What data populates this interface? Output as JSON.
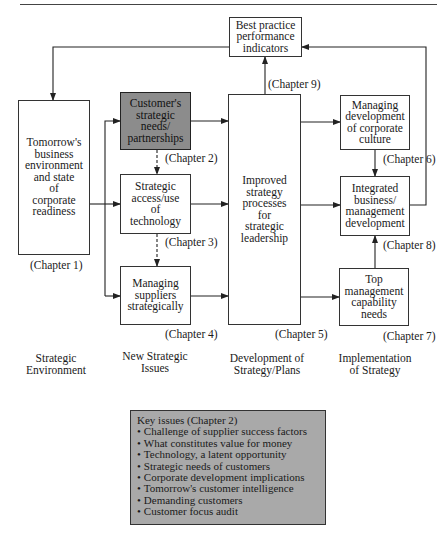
{
  "diagram": {
    "boxes": {
      "best_practice": {
        "label": "Best practice\nperformance\nindicators",
        "chapter": "(Chapter 9)"
      },
      "tomorrows_environment": {
        "label": "Tomorrow's\nbusiness\nenvironment\nand state\nof\ncorporate\nreadiness",
        "chapter": "(Chapter 1)"
      },
      "customer_needs": {
        "label": "Customer's\nstrategic\nneeds/\npartnerships",
        "chapter": "(Chapter 2)",
        "highlighted": true
      },
      "strategic_access": {
        "label": "Strategic\naccess/use\nof\ntechnology",
        "chapter": "(Chapter 3)"
      },
      "managing_suppliers": {
        "label": "Managing\nsuppliers\nstrategically",
        "chapter": "(Chapter 4)"
      },
      "improved_strategy": {
        "label": "Improved\nstrategy\nprocesses\nfor\nstrategic\nleadership",
        "chapter": "(Chapter 5)"
      },
      "corporate_culture": {
        "label": "Managing\ndevelopment\nof corporate\nculture",
        "chapter": "(Chapter 6)"
      },
      "integrated_development": {
        "label": "Integrated\nbusiness/\nmanagement\ndevelopment",
        "chapter": "(Chapter 8)"
      },
      "top_management": {
        "label": "Top\nmanagement\ncapability\nneeds",
        "chapter": "(Chapter 7)"
      }
    },
    "columns": [
      "Strategic\nEnvironment",
      "New Strategic\nIssues",
      "Development of\nStrategy/Plans",
      "Implementation\nof Strategy"
    ],
    "colors": {
      "highlight_box": "#8c8c8c",
      "key_box": "#a9a9a9",
      "line": "#222222"
    }
  },
  "key_issues": {
    "title": "Key issues (Chapter 2)",
    "items": [
      "Challenge of supplier success factors",
      "What constitutes value for money",
      "Technology, a latent opportunity",
      "Strategic needs of customers",
      "Corporate development implications",
      "Tomorrow's customer intelligence",
      "Demanding customers",
      "Customer focus audit"
    ]
  }
}
